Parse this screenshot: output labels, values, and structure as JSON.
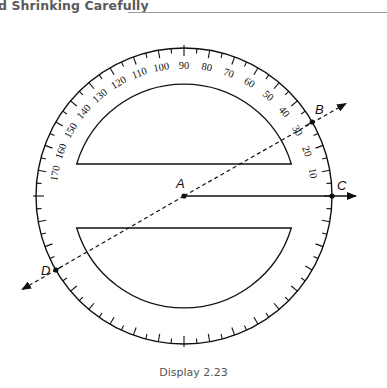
{
  "header": {
    "title": "d Shrinking Carefully"
  },
  "figure": {
    "type": "protractor-diagram",
    "scale_labels": [
      "10",
      "20",
      "30",
      "40",
      "50",
      "60",
      "70",
      "80",
      "90",
      "100",
      "110",
      "120",
      "130",
      "140",
      "150",
      "160",
      "170"
    ],
    "points": {
      "A": "A",
      "B": "B",
      "C": "C",
      "D": "D"
    },
    "ray_AC_angle_deg": 0,
    "line_DB_angle_deg": 30,
    "tick_interval_deg": 5,
    "stroke_color": "#111111"
  },
  "caption": "Display 2.23"
}
